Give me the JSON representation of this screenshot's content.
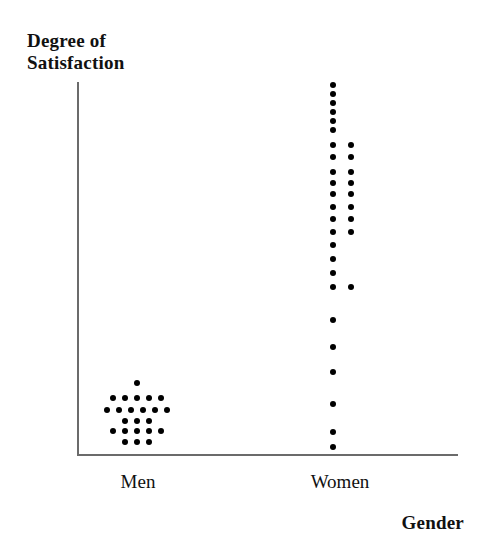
{
  "chart_data": {
    "type": "scatter",
    "title": "Degree of Satisfaction",
    "ylabel": "Degree of Satisfaction",
    "xlabel": "Gender",
    "categories": [
      "Men",
      "Women"
    ],
    "grid": false,
    "legend": null,
    "axis": {
      "y_label_lines": "Degree of\nSatisfaction",
      "x_label": "Gender",
      "y_ticks": [],
      "x_ticks": [
        "Men",
        "Women"
      ],
      "note": "Unlabeled ordinal vertical scale; dots stacked by satisfaction level"
    },
    "series": [
      {
        "name": "Men",
        "count": 23,
        "description": "Tight low cluster near the bottom of the satisfaction scale",
        "rows": [
          {
            "level": 6,
            "dots": 1
          },
          {
            "level": 5,
            "dots": 5
          },
          {
            "level": 4,
            "dots": 6
          },
          {
            "level": 3,
            "dots": 3
          },
          {
            "level": 2,
            "dots": 5
          },
          {
            "level": 1,
            "dots": 3
          }
        ],
        "points": [
          {
            "x": 137,
            "y": 383
          },
          {
            "x": 113,
            "y": 398
          },
          {
            "x": 125,
            "y": 398
          },
          {
            "x": 137,
            "y": 398
          },
          {
            "x": 149,
            "y": 398
          },
          {
            "x": 161,
            "y": 398
          },
          {
            "x": 107,
            "y": 410
          },
          {
            "x": 119,
            "y": 410
          },
          {
            "x": 131,
            "y": 410
          },
          {
            "x": 143,
            "y": 410
          },
          {
            "x": 155,
            "y": 410
          },
          {
            "x": 167,
            "y": 410
          },
          {
            "x": 125,
            "y": 421
          },
          {
            "x": 137,
            "y": 421
          },
          {
            "x": 149,
            "y": 421
          },
          {
            "x": 113,
            "y": 431
          },
          {
            "x": 125,
            "y": 431
          },
          {
            "x": 137,
            "y": 431
          },
          {
            "x": 149,
            "y": 431
          },
          {
            "x": 161,
            "y": 431
          },
          {
            "x": 125,
            "y": 442
          },
          {
            "x": 137,
            "y": 442
          },
          {
            "x": 149,
            "y": 442
          }
        ]
      },
      {
        "name": "Women",
        "count": 34,
        "description": "Spread from the very top of the satisfaction scale down to the bottom, dense at the top",
        "points": [
          {
            "x": 333,
            "y": 85
          },
          {
            "x": 333,
            "y": 94
          },
          {
            "x": 333,
            "y": 103
          },
          {
            "x": 333,
            "y": 112
          },
          {
            "x": 333,
            "y": 121
          },
          {
            "x": 333,
            "y": 130
          },
          {
            "x": 333,
            "y": 145
          },
          {
            "x": 351,
            "y": 145
          },
          {
            "x": 333,
            "y": 157
          },
          {
            "x": 351,
            "y": 157
          },
          {
            "x": 333,
            "y": 172
          },
          {
            "x": 351,
            "y": 172
          },
          {
            "x": 333,
            "y": 183
          },
          {
            "x": 351,
            "y": 183
          },
          {
            "x": 333,
            "y": 194
          },
          {
            "x": 351,
            "y": 194
          },
          {
            "x": 333,
            "y": 207
          },
          {
            "x": 351,
            "y": 207
          },
          {
            "x": 333,
            "y": 219
          },
          {
            "x": 351,
            "y": 219
          },
          {
            "x": 333,
            "y": 232
          },
          {
            "x": 351,
            "y": 232
          },
          {
            "x": 333,
            "y": 245
          },
          {
            "x": 333,
            "y": 259
          },
          {
            "x": 333,
            "y": 273
          },
          {
            "x": 333,
            "y": 287
          },
          {
            "x": 351,
            "y": 287
          },
          {
            "x": 333,
            "y": 320
          },
          {
            "x": 333,
            "y": 347
          },
          {
            "x": 333,
            "y": 372
          },
          {
            "x": 333,
            "y": 404
          },
          {
            "x": 333,
            "y": 432
          },
          {
            "x": 333,
            "y": 447
          }
        ]
      }
    ]
  },
  "labels": {
    "title_line1": "Degree of",
    "title_line2": "Satisfaction",
    "title_full": "Degree of\nSatisfaction",
    "men": "Men",
    "women": "Women",
    "gender": "Gender"
  }
}
